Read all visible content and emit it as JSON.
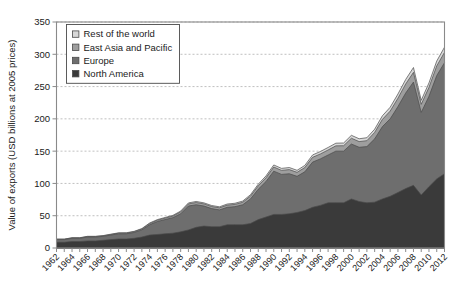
{
  "chart_data": {
    "type": "area",
    "stacked": true,
    "title": "",
    "xlabel": "",
    "ylabel": "Value of exports (USD billions at 2005 prices)",
    "ylim": [
      0,
      350
    ],
    "yticks": [
      0,
      50,
      100,
      150,
      200,
      250,
      300,
      350
    ],
    "grid": true,
    "grid_axis": "y",
    "legend_position": "top-left",
    "x": [
      1962,
      1963,
      1964,
      1965,
      1966,
      1967,
      1968,
      1969,
      1970,
      1971,
      1972,
      1973,
      1974,
      1975,
      1976,
      1977,
      1978,
      1979,
      1980,
      1981,
      1982,
      1983,
      1984,
      1985,
      1986,
      1987,
      1988,
      1989,
      1990,
      1991,
      1992,
      1993,
      1994,
      1995,
      1996,
      1997,
      1998,
      1999,
      2000,
      2001,
      2002,
      2003,
      2004,
      2005,
      2006,
      2007,
      2008,
      2009,
      2010,
      2011,
      2012
    ],
    "xtick_labels": [
      "1962",
      "1964",
      "1966",
      "1968",
      "1970",
      "1972",
      "1974",
      "1976",
      "1978",
      "1980",
      "1982",
      "1984",
      "1986",
      "1988",
      "1990",
      "1992",
      "1994",
      "1996",
      "1998",
      "2000",
      "2002",
      "2004",
      "2006",
      "2008",
      "2010",
      "2012"
    ],
    "xtick_step_years": 2,
    "series": [
      {
        "name": "North America",
        "color": "#3a3a3a",
        "values": [
          9,
          9,
          10,
          10,
          11,
          11,
          12,
          13,
          14,
          14,
          15,
          17,
          20,
          21,
          22,
          23,
          25,
          28,
          32,
          34,
          33,
          33,
          36,
          36,
          36,
          38,
          44,
          48,
          52,
          52,
          53,
          55,
          58,
          63,
          66,
          70,
          70,
          70,
          76,
          72,
          70,
          71,
          76,
          80,
          86,
          92,
          97,
          82,
          95,
          107,
          115
        ]
      },
      {
        "name": "Europe",
        "color": "#6e6e6e",
        "values": [
          4,
          4,
          5,
          5,
          6,
          6,
          6,
          7,
          8,
          8,
          9,
          11,
          16,
          20,
          22,
          24,
          28,
          37,
          35,
          31,
          28,
          26,
          27,
          28,
          31,
          38,
          47,
          55,
          67,
          62,
          62,
          56,
          60,
          70,
          72,
          74,
          80,
          80,
          85,
          84,
          87,
          98,
          112,
          120,
          133,
          148,
          160,
          128,
          140,
          160,
          172
        ]
      },
      {
        "name": "East Asia and Pacific",
        "color": "#9e9e9e",
        "values": [
          0.5,
          0.5,
          0.6,
          0.6,
          0.7,
          0.7,
          0.8,
          0.9,
          1.0,
          1.1,
          1.2,
          1.4,
          1.8,
          2.0,
          2.2,
          2.4,
          2.8,
          3.2,
          3.4,
          3.3,
          3.2,
          3.2,
          3.4,
          3.5,
          3.8,
          4.4,
          5.2,
          5.8,
          6.4,
          6.2,
          6.4,
          6.2,
          6.6,
          7.4,
          7.6,
          7.8,
          8.2,
          8.4,
          9.0,
          8.8,
          9.2,
          10.0,
          11.2,
          12.0,
          13.0,
          14.0,
          15.0,
          12.5,
          13.8,
          15.0,
          16.0
        ]
      },
      {
        "name": "Rest of the world",
        "color": "#d8d8d8",
        "values": [
          0.3,
          0.3,
          0.3,
          0.3,
          0.4,
          0.4,
          0.4,
          0.5,
          0.5,
          0.5,
          0.6,
          0.7,
          0.9,
          1.0,
          1.1,
          1.2,
          1.4,
          1.6,
          1.7,
          1.6,
          1.6,
          1.6,
          1.7,
          1.8,
          1.9,
          2.2,
          2.6,
          2.9,
          3.2,
          3.1,
          3.2,
          3.1,
          3.3,
          3.7,
          3.8,
          3.9,
          4.1,
          4.2,
          4.5,
          4.4,
          4.6,
          5.0,
          5.6,
          6.0,
          6.5,
          7.0,
          7.5,
          6.2,
          6.9,
          7.5,
          8.0
        ]
      }
    ],
    "legend_entries": [
      {
        "label": "Rest of the world",
        "color": "#d8d8d8"
      },
      {
        "label": "East Asia and Pacific",
        "color": "#9e9e9e"
      },
      {
        "label": "Europe",
        "color": "#6e6e6e"
      },
      {
        "label": "North America",
        "color": "#3a3a3a"
      }
    ]
  }
}
